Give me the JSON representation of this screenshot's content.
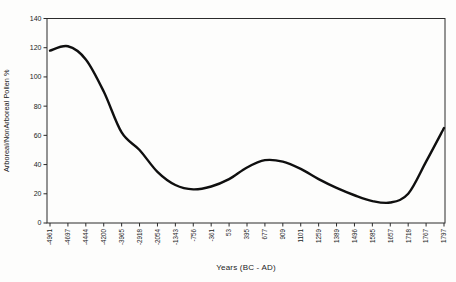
{
  "figure": {
    "background": "#fdfdfc",
    "frame_color": "#2b2b2b",
    "curve_color": "#0f0f0f",
    "text_color": "#1c1c1c"
  },
  "chart_data": {
    "type": "line",
    "title": "",
    "xlabel": "Years (BC - AD)",
    "ylabel": "Arboreal/NonArboreal Pollen %",
    "categories": [
      "-4961",
      "-4697",
      "-4444",
      "-4200",
      "-3965",
      "-2918",
      "-2054",
      "-1343",
      "-756",
      "-361",
      "53",
      "395",
      "677",
      "909",
      "1101",
      "1259",
      "1389",
      "1496",
      "1585",
      "1657",
      "1718",
      "1767",
      "1797"
    ],
    "values": [
      118,
      121,
      112,
      90,
      62,
      50,
      35,
      26,
      23,
      25,
      30,
      38,
      43,
      42,
      37,
      30,
      24,
      19,
      15,
      14,
      20,
      42,
      65
    ],
    "y_ticks": [
      0,
      20,
      40,
      60,
      80,
      100,
      120,
      140
    ],
    "ylim": [
      0,
      140
    ],
    "grid": false,
    "legend": false,
    "smooth": true,
    "x_label_rotation": -90,
    "plot_border": "full-frame"
  }
}
